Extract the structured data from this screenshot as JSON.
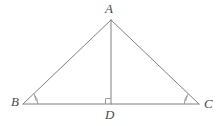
{
  "figure": {
    "kind": "geometry-diagram",
    "background_color": "#ffffff",
    "stroke_color": "#808080",
    "mark_color": "#9a9a9a",
    "label_color": "#4a4a4a",
    "stroke_width": 1,
    "canvas": {
      "width": 224,
      "height": 126
    },
    "points": {
      "A": {
        "label": "A",
        "x": 111,
        "y": 20
      },
      "B": {
        "label": "B",
        "x": 23,
        "y": 104
      },
      "C": {
        "label": "C",
        "x": 199,
        "y": 104
      },
      "D": {
        "label": "D",
        "x": 111,
        "y": 104
      }
    },
    "segments": [
      {
        "name": "AB",
        "from": "A",
        "to": "B"
      },
      {
        "name": "AC",
        "from": "A",
        "to": "C"
      },
      {
        "name": "BC",
        "from": "B",
        "to": "C"
      },
      {
        "name": "AD",
        "from": "A",
        "to": "D"
      }
    ],
    "markers": [
      {
        "name": "angle-B",
        "type": "angle-arc-single-tick",
        "at": "B"
      },
      {
        "name": "angle-C",
        "type": "angle-arc-single-tick",
        "at": "C"
      },
      {
        "name": "angle-D",
        "type": "right-angle-square",
        "at": "D"
      }
    ]
  }
}
